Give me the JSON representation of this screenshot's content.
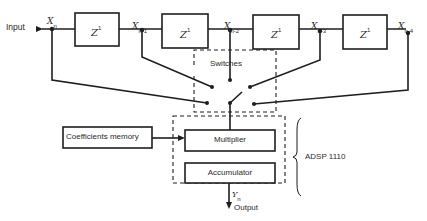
{
  "diagram": {
    "type": "FIR filter block diagram",
    "input_label": "Input",
    "output_label": "Output",
    "delay_blocks": [
      {
        "label": "Z",
        "exponent": "1"
      },
      {
        "label": "Z",
        "exponent": "1"
      },
      {
        "label": "Z",
        "exponent": "1"
      },
      {
        "label": "Z",
        "exponent": "1"
      }
    ],
    "taps": [
      {
        "symbol": "X",
        "subscript": "n"
      },
      {
        "symbol": "X",
        "subscript": "n-1"
      },
      {
        "symbol": "X",
        "subscript": "n-2"
      },
      {
        "symbol": "X",
        "subscript": "n-3"
      },
      {
        "symbol": "X",
        "subscript": "n-4"
      }
    ],
    "switches_label": "Switches",
    "coefficients_label": "Coefficients memory",
    "multiplier_label": "Multiplier",
    "accumulator_label": "Accumulator",
    "output_symbol": {
      "symbol": "Y",
      "subscript": "n"
    },
    "chip_label": "ADSP 1110",
    "colors": {
      "line": "#1e1e1e",
      "background": "#ffffff",
      "text": "#2a2a2a"
    }
  }
}
